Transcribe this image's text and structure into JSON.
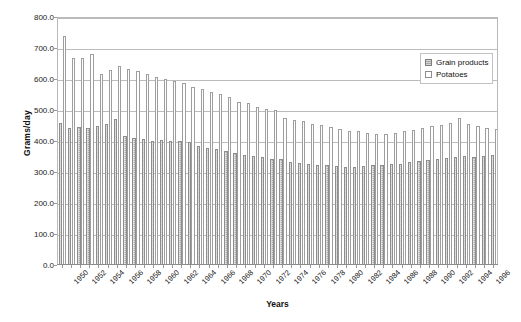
{
  "chart_data": {
    "type": "bar",
    "title": "",
    "xlabel": "Years",
    "ylabel": "Grams/day",
    "ylim": [
      0,
      800
    ],
    "ytick_labels": [
      "0.0",
      "100.0",
      "200.0",
      "300.0",
      "400.0",
      "500.0",
      "600.0",
      "700.0",
      "800.0"
    ],
    "ytick_values": [
      0,
      100,
      200,
      300,
      400,
      500,
      600,
      700,
      800
    ],
    "grid": true,
    "legend_position": "top-right",
    "categories": [
      "1950",
      "1951",
      "1952",
      "1953",
      "1954",
      "1955",
      "1956",
      "1957",
      "1958",
      "1959",
      "1960",
      "1961",
      "1962",
      "1963",
      "1964",
      "1965",
      "1966",
      "1967",
      "1968",
      "1969",
      "1970",
      "1971",
      "1972",
      "1973",
      "1974",
      "1975",
      "1976",
      "1977",
      "1978",
      "1979",
      "1980",
      "1981",
      "1982",
      "1983",
      "1984",
      "1985",
      "1986",
      "1987",
      "1988",
      "1989",
      "1990",
      "1991",
      "1992",
      "1993",
      "1994",
      "1995",
      "1996",
      "1997"
    ],
    "tick_label_categories": [
      "1950",
      "1952",
      "1954",
      "1956",
      "1958",
      "1960",
      "1962",
      "1964",
      "1966",
      "1968",
      "1970",
      "1972",
      "1974",
      "1976",
      "1978",
      "1980",
      "1982",
      "1984",
      "1986",
      "1988",
      "1990",
      "1992",
      "1994",
      "1996"
    ],
    "series": [
      {
        "name": "Grain products",
        "color": "#a8a8a8",
        "values": [
          455,
          438,
          441,
          438,
          444,
          452,
          468,
          412,
          408,
          404,
          398,
          400,
          398,
          397,
          392,
          380,
          374,
          372,
          366,
          358,
          352,
          348,
          344,
          340,
          338,
          330,
          326,
          322,
          320,
          318,
          316,
          312,
          312,
          316,
          318,
          320,
          322,
          324,
          328,
          332,
          336,
          340,
          342,
          344,
          348,
          346,
          348,
          352
        ]
      },
      {
        "name": "Potatoes",
        "color": "#ffffff",
        "values": [
          736,
          664,
          664,
          678,
          612,
          626,
          640,
          630,
          624,
          612,
          604,
          598,
          590,
          584,
          572,
          566,
          556,
          548,
          540,
          524,
          518,
          508,
          500,
          496,
          470,
          466,
          460,
          452,
          448,
          442,
          436,
          430,
          428,
          424,
          420,
          418,
          424,
          430,
          432,
          438,
          444,
          450,
          456,
          470,
          452,
          444,
          440,
          436
        ]
      }
    ]
  },
  "legend": {
    "items": [
      {
        "label": "Grain products",
        "swatch": "grain"
      },
      {
        "label": "Potatoes",
        "swatch": "potato"
      }
    ]
  }
}
